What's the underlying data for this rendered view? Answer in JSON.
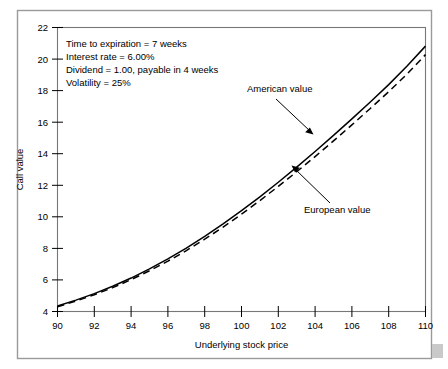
{
  "figure": {
    "background_color": "#ffffff",
    "frame_color": "#9a9a9a",
    "plot_border_color": "#777777",
    "corner_mark_color": "#c9c9c9"
  },
  "chart_data": {
    "type": "line",
    "title": "",
    "xlabel": "Underlying stock price",
    "ylabel": "Call value",
    "xlim": [
      90,
      110
    ],
    "ylim": [
      4,
      22
    ],
    "xticks": [
      90,
      92,
      94,
      96,
      98,
      100,
      102,
      104,
      106,
      108,
      110
    ],
    "xtick_labels": [
      "90",
      "92",
      "94",
      "96",
      "98",
      "100",
      "102",
      "104",
      "106",
      "108",
      "110"
    ],
    "yticks": [
      4,
      6,
      8,
      10,
      12,
      14,
      16,
      18,
      20,
      22
    ],
    "ytick_labels": [
      "4",
      "6",
      "8",
      "10",
      "12",
      "14",
      "16",
      "18",
      "20",
      "22"
    ],
    "grid": false,
    "legend_position": "inline-annotations",
    "x": [
      90,
      91,
      92,
      93,
      94,
      95,
      96,
      97,
      98,
      99,
      100,
      101,
      102,
      103,
      104,
      105,
      106,
      107,
      108,
      109,
      110
    ],
    "series": [
      {
        "name": "American value",
        "style": "solid",
        "color": "#000000",
        "values": [
          4.35,
          4.72,
          5.13,
          5.6,
          6.12,
          6.7,
          7.33,
          8.02,
          8.76,
          9.55,
          10.39,
          11.27,
          12.19,
          13.15,
          14.14,
          15.16,
          16.21,
          17.28,
          18.38,
          19.56,
          20.82
        ]
      },
      {
        "name": "European value",
        "style": "dashed",
        "color": "#000000",
        "values": [
          4.3,
          4.66,
          5.06,
          5.51,
          6.02,
          6.58,
          7.19,
          7.86,
          8.58,
          9.35,
          10.17,
          11.03,
          11.93,
          12.86,
          13.82,
          14.81,
          15.83,
          16.87,
          17.93,
          19.05,
          20.28
        ]
      }
    ],
    "annotations": {
      "parameters": [
        "Time to expiration = 7 weeks",
        "Interest rate = 6.00%",
        "Dividend = 1.00, payable in 4 weeks",
        "Volatility = 25%"
      ],
      "american_label": "American value",
      "european_label": "European value"
    }
  }
}
